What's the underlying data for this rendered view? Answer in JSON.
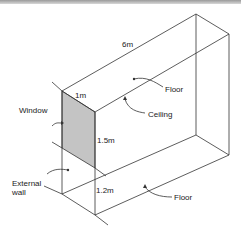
{
  "diagram": {
    "type": "isometric-room",
    "labels": {
      "length": "6m",
      "width": "1m",
      "window_height": "1.5m",
      "sill_height": "1.2m",
      "floor_top": "Floor",
      "ceiling": "Ceiling",
      "window": "Window",
      "external_wall_line1": "External",
      "external_wall_line2": "wall",
      "floor_bottom": "Floor"
    },
    "colors": {
      "line": "#333333",
      "window_fill": "#bdbdbd"
    }
  }
}
